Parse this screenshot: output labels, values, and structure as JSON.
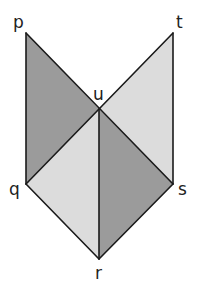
{
  "diagram": {
    "type": "geometry",
    "points": {
      "p": {
        "label": "p",
        "x": 26,
        "y": 33
      },
      "t": {
        "label": "t",
        "x": 173,
        "y": 33
      },
      "u": {
        "label": "u",
        "x": 99,
        "y": 109
      },
      "q": {
        "label": "q",
        "x": 26,
        "y": 184
      },
      "s": {
        "label": "s",
        "x": 173,
        "y": 184
      },
      "r": {
        "label": "r",
        "x": 99,
        "y": 259
      }
    },
    "regions": [
      {
        "name": "triangle-pqu",
        "vertices": [
          "p",
          "q",
          "u"
        ],
        "shade": "dark"
      },
      {
        "name": "triangle-uts",
        "vertices": [
          "u",
          "t",
          "s"
        ],
        "shade": "light"
      },
      {
        "name": "triangle-uqr",
        "vertices": [
          "u",
          "q",
          "r"
        ],
        "shade": "light"
      },
      {
        "name": "triangle-usr",
        "vertices": [
          "u",
          "s",
          "r"
        ],
        "shade": "dark"
      }
    ],
    "colors": {
      "dark": "#9b9b9b",
      "light": "#dcdcdc",
      "stroke": "#1a1a1a"
    }
  }
}
